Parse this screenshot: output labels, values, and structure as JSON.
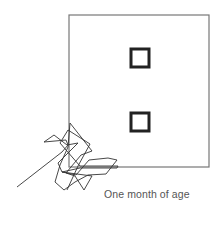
{
  "figure": {
    "caption": "One month of age",
    "colors": {
      "background": "#ffffff",
      "frame": "#777777",
      "feature": "#222222",
      "scanpath": "#333333",
      "caption": "#555555"
    },
    "stimulus": {
      "outline": {
        "x": 69,
        "y": 15,
        "width": 140,
        "height": 152
      },
      "features": [
        {
          "name": "upper-square",
          "x": 131,
          "y": 49,
          "width": 18,
          "height": 18
        },
        {
          "name": "lower-square",
          "x": 131,
          "y": 113,
          "width": 18,
          "height": 18
        }
      ]
    },
    "scanpath_points": "17,187 62,152 68,145 66,140 44,142 54,135 67,145 78,143 58,163 62,172 76,175 89,160 108,158 117,160 106,174 88,175 75,182 64,190 55,182 60,165 68,147 70,123 92,151 81,155 66,173 75,176 84,190 92,176 62,172 80,168 117,168 118,166 80,166 66,150 60,143 68,130 90,144 78,166 67,190"
  }
}
